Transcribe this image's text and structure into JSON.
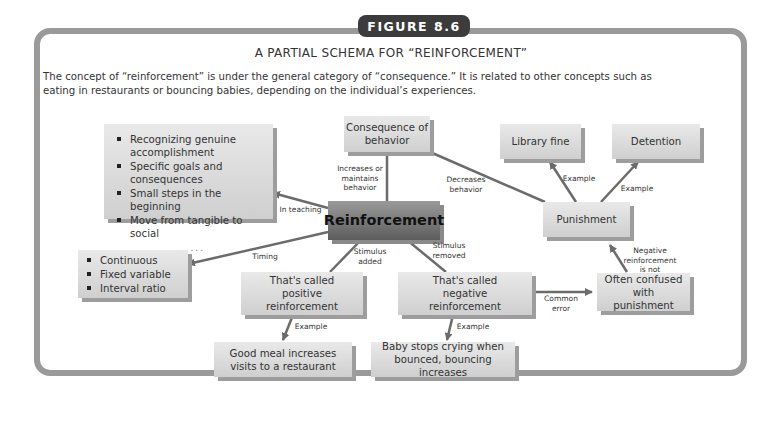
{
  "figure": {
    "badge": "FIGURE 8.6",
    "title": "A PARTIAL SCHEMA FOR “REINFORCEMENT”",
    "description": "The concept of “reinforcement” is under the general category of “consequence.” It is related to other concepts such as eating in restaurants or bouncing babies, depending on the individual’s experiences."
  },
  "nodes": {
    "reinforcement": "Reinforcement",
    "consequence": "Consequence of behavior",
    "teaching_list": [
      "Recognizing genuine accomplishment",
      "Specific goals and consequences",
      "Small steps in the beginning",
      "Move from tangible to social"
    ],
    "teaching_more": "......",
    "timing_list": [
      "Continuous",
      "Fixed variable",
      "Interval ratio"
    ],
    "positive": "That's called positive reinforcement",
    "negative": "That's called negative reinforcement",
    "good_meal": "Good meal increases visits to a restaurant",
    "baby": "Baby stops crying when bounced, bouncing increases",
    "confused": "Often confused with punishment",
    "punishment": "Punishment",
    "library_fine": "Library fine",
    "detention": "Detention"
  },
  "edges": {
    "increases": "Increases or maintains behavior",
    "decreases": "Decreases behavior",
    "in_teaching": "In teaching",
    "timing": "Timing",
    "stim_added": "Stimulus added",
    "stim_removed": "Stimulus removed",
    "example_pos": "Example",
    "example_neg": "Example",
    "common_error": "Common error",
    "neg_not": "Negative reinforcement is not",
    "example_fine": "Example",
    "example_det": "Example"
  }
}
